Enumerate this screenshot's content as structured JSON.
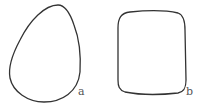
{
  "diagram": {
    "shapes": [
      {
        "id": "a",
        "kind": "egg-shaped closed curve",
        "label": "a"
      },
      {
        "id": "b",
        "kind": "rounded square closed curve",
        "label": "b"
      }
    ],
    "stroke_color": "#333333"
  }
}
